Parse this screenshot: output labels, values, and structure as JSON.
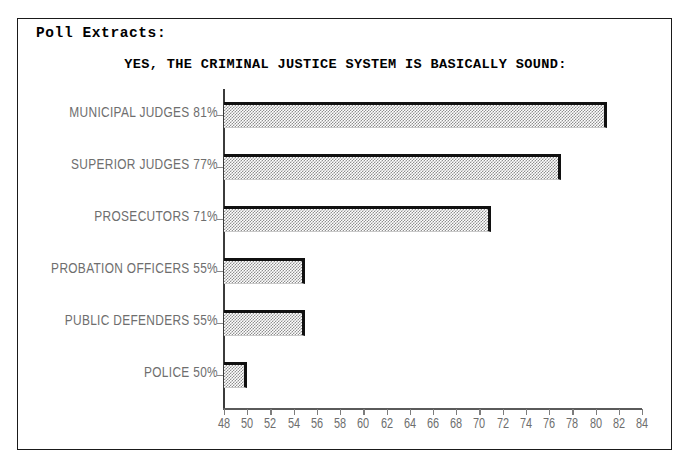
{
  "document": {
    "header": "Poll Extracts:"
  },
  "chart_data": {
    "type": "bar",
    "orientation": "horizontal",
    "title": "YES, THE CRIMINAL JUSTICE SYSTEM IS BASICALLY SOUND:",
    "xlabel": "",
    "ylabel": "",
    "xlim": [
      48,
      84
    ],
    "grid": false,
    "legend": null,
    "categories": [
      "MUNICIPAL JUDGES",
      "SUPERIOR JUDGES",
      "PROSECUTORS",
      "PROBATION OFFICERS",
      "PUBLIC DEFENDERS",
      "POLICE"
    ],
    "values": [
      81,
      77,
      71,
      55,
      55,
      50
    ],
    "value_suffix": "%",
    "bar_labels": [
      "MUNICIPAL JUDGES 81%",
      "SUPERIOR JUDGES 77%",
      "PROSECUTORS 71%",
      "PROBATION OFFICERS 55%",
      "PUBLIC DEFENDERS 55%",
      "POLICE 50%"
    ],
    "xticks": [
      48,
      50,
      52,
      54,
      56,
      58,
      60,
      62,
      64,
      66,
      68,
      70,
      72,
      74,
      76,
      78,
      80,
      82,
      84
    ],
    "xtick_labels": [
      "48",
      "50",
      "52",
      "54",
      "56",
      "58",
      "60",
      "62",
      "64",
      "66",
      "68",
      "70",
      "72",
      "74",
      "76",
      "78",
      "80",
      "82",
      "84"
    ],
    "colors": {
      "bar_fill": "#8f8f8f",
      "bar_border": "#101010",
      "axis": "#5a5a5a",
      "label_text": "#6e6e6e",
      "title_text": "#000000",
      "frame": "#1a1a1a",
      "background": "#ffffff"
    }
  }
}
